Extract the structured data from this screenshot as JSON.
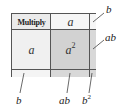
{
  "diagram": {
    "header": {
      "corner_label": "Multiply",
      "column_label": "a"
    },
    "row_label": "a",
    "product_cell": {
      "base": "a",
      "exponent": "2"
    },
    "callouts": {
      "top_right": "b",
      "right_middle": "ab",
      "bottom_left": "b",
      "bottom_middle": "ab",
      "bottom_right_base": "b",
      "bottom_right_exponent": "2"
    },
    "colors": {
      "border": "#555555",
      "product_fill": "#d2d2d2",
      "header_fill": "#f6f6f6",
      "corner_fill": "#ebebeb",
      "row_label_fill": "#f0f0f0",
      "strip_fill": "#f4f4f4",
      "strip_shaded": "#d8d8d8"
    }
  }
}
